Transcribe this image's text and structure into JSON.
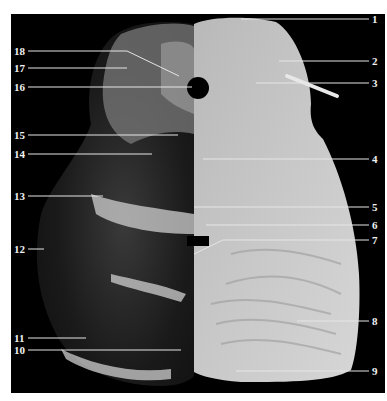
{
  "figure": {
    "labels_left": [
      {
        "id": "18",
        "text": "18"
      },
      {
        "id": "17",
        "text": "17"
      },
      {
        "id": "16",
        "text": "16"
      },
      {
        "id": "15",
        "text": "15"
      },
      {
        "id": "14",
        "text": "14"
      },
      {
        "id": "13",
        "text": "13"
      },
      {
        "id": "12",
        "text": "12"
      },
      {
        "id": "11",
        "text": "11"
      },
      {
        "id": "10",
        "text": "10"
      }
    ],
    "labels_right": [
      {
        "id": "1",
        "text": "1"
      },
      {
        "id": "2",
        "text": "2"
      },
      {
        "id": "3",
        "text": "3"
      },
      {
        "id": "4",
        "text": "4"
      },
      {
        "id": "5",
        "text": "5"
      },
      {
        "id": "6",
        "text": "6"
      },
      {
        "id": "7",
        "text": "7"
      },
      {
        "id": "8",
        "text": "8"
      },
      {
        "id": "9",
        "text": "9"
      }
    ]
  }
}
